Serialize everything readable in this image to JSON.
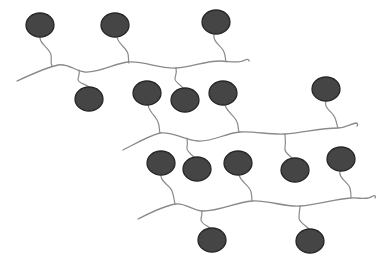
{
  "diagram": {
    "title": "",
    "colors": {
      "background": "#ffffff",
      "bead_fill": "#454545",
      "bead_stroke": "#262626",
      "line": "#8a8a8a"
    },
    "chains": [
      {
        "id": "chain-1",
        "path": "M17,81 C30,75 45,68 58,65 C68,63 75,71 85,72 C100,73 115,63 128,62 C145,61 160,69 176,68 C192,67 205,61 220,61 C230,61 238,64 245,60 C247,59 249,59 249,61"
      },
      {
        "id": "chain-2",
        "path": "M123,150 C135,144 148,136 160,133 C172,131 185,140 198,141 C212,142 226,133 240,132 C255,131 270,135 285,134 C302,133 320,128 338,128 C346,128 350,124 356,123 C358,123 358,125 357,126"
      },
      {
        "id": "chain-3",
        "path": "M138,219 C150,213 163,206 176,204 C186,203 193,211 203,211 C220,211 236,202 252,201 C268,200 284,207 300,206 C318,205 334,199 351,198 C360,197 366,201 373,196 C375,195 376,196 375,198"
      }
    ],
    "beads": [
      {
        "id": "bead-1",
        "cx": 40,
        "cy": 25,
        "rx": 14,
        "ry": 12,
        "tether": "M40,37 C39,44 50,48 51,55 C52,60 50,62 52,66"
      },
      {
        "id": "bead-2",
        "cx": 115,
        "cy": 25,
        "rx": 14,
        "ry": 12,
        "tether": "M117,37 C118,44 127,48 128,54 C129,58 128,61 129,63"
      },
      {
        "id": "bead-3",
        "cx": 216,
        "cy": 22,
        "rx": 14,
        "ry": 12,
        "tether": "M214,34 C212,42 222,46 224,52 C226,57 225,59 226,62"
      },
      {
        "id": "bead-4",
        "cx": 89,
        "cy": 99,
        "rx": 14,
        "ry": 12,
        "tether": "M89,87 C86,84 77,83 78,79 C79,75 80,73 79,70"
      },
      {
        "id": "bead-5",
        "cx": 147,
        "cy": 93,
        "rx": 14,
        "ry": 12,
        "tether": "M148,105 C149,112 156,116 158,122 C160,127 159,130 160,133"
      },
      {
        "id": "bead-6",
        "cx": 185,
        "cy": 100,
        "rx": 14,
        "ry": 12,
        "tether": "M183,88 C181,85 174,82 175,78 C176,74 177,72 176,68"
      },
      {
        "id": "bead-7",
        "cx": 223,
        "cy": 93,
        "rx": 14,
        "ry": 12,
        "tether": "M225,105 C227,112 235,116 237,122 C239,127 238,130 239,132"
      },
      {
        "id": "bead-8",
        "cx": 326,
        "cy": 89,
        "rx": 14,
        "ry": 12,
        "tether": "M326,101 C323,108 333,112 335,118 C337,123 337,126 338,128"
      },
      {
        "id": "bead-9",
        "cx": 161,
        "cy": 163,
        "rx": 14,
        "ry": 12,
        "tether": "M161,175 C160,182 170,185 172,191 C174,196 174,200 175,204"
      },
      {
        "id": "bead-10",
        "cx": 197,
        "cy": 169,
        "rx": 14,
        "ry": 12,
        "tether": "M194,157 C190,153 186,151 187,147 C188,143 187,140 187,138"
      },
      {
        "id": "bead-11",
        "cx": 238,
        "cy": 163,
        "rx": 14,
        "ry": 12,
        "tether": "M239,175 C241,182 250,186 251,192 C252,196 252,199 252,201"
      },
      {
        "id": "bead-12",
        "cx": 295,
        "cy": 170,
        "rx": 14,
        "ry": 12,
        "tether": "M292,158 C288,154 284,152 285,147 C286,142 285,138 285,134"
      },
      {
        "id": "bead-13",
        "cx": 341,
        "cy": 159,
        "rx": 14,
        "ry": 12,
        "tether": "M340,171 C338,178 348,182 350,188 C351,192 351,195 351,198"
      },
      {
        "id": "bead-14",
        "cx": 212,
        "cy": 240,
        "rx": 14,
        "ry": 12,
        "tether": "M210,228 C206,225 200,223 201,219 C202,215 202,213 202,211"
      },
      {
        "id": "bead-15",
        "cx": 310,
        "cy": 241,
        "rx": 14,
        "ry": 12,
        "tether": "M309,229 C305,225 299,222 299,218 C299,213 300,209 300,206"
      }
    ]
  }
}
